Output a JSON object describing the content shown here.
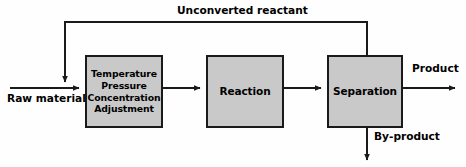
{
  "diagram": {
    "type": "process-flow-diagram",
    "background_color": "#fefefe",
    "box_fill_color": "#c9c9c9",
    "line_color": "#1a1a1a",
    "text_color": "#000000",
    "boxes": [
      {
        "id": "adjustment",
        "name": "Temperature Pressure Concentration Adjustment",
        "lines": [
          "Temperature",
          "Pressure",
          "Concentration",
          "Adjustment"
        ]
      },
      {
        "id": "reaction",
        "name": "Reaction",
        "lines": [
          "Reaction"
        ]
      },
      {
        "id": "separation",
        "name": "Separation",
        "lines": [
          "Separation"
        ]
      }
    ],
    "stream_labels": {
      "raw_material": "Raw material",
      "unconverted_reactant": "Unconverted reactant",
      "product": "Product",
      "byproduct": "By-product"
    },
    "connections": [
      {
        "from": "raw-material-inlet",
        "to": "adjustment",
        "label": "Raw material"
      },
      {
        "from": "adjustment",
        "to": "reaction",
        "label": ""
      },
      {
        "from": "reaction",
        "to": "separation",
        "label": ""
      },
      {
        "from": "separation",
        "to": "product-outlet",
        "label": "Product"
      },
      {
        "from": "separation",
        "to": "byproduct-outlet",
        "label": "By-product"
      },
      {
        "from": "separation",
        "to": "adjustment-inlet",
        "label": "Unconverted reactant"
      }
    ]
  }
}
